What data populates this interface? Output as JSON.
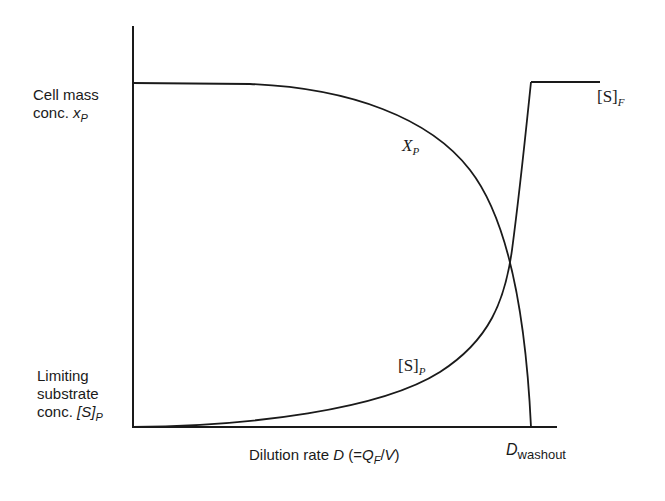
{
  "diagram": {
    "y_axis_labels": {
      "top": {
        "line1": "Cell mass",
        "line2_prefix": "conc. ",
        "var": "x",
        "sub": "P"
      },
      "bottom": {
        "line1": "Limiting",
        "line2": "substrate",
        "line3_prefix": "conc. ",
        "var": "[S]",
        "sub": "P"
      }
    },
    "x_axis_label": {
      "prefix": "Dilution rate ",
      "var": "D",
      "paren_open": " (=",
      "q": "Q",
      "q_sub": "F",
      "slash": "/",
      "v": "V",
      "paren_close": ")"
    },
    "washout_label": {
      "var": "D",
      "sub": "washout"
    },
    "curves": {
      "xp": {
        "var": "X",
        "sub": "P"
      },
      "sp": {
        "var": "[S]",
        "sub": "P"
      },
      "sf": {
        "var": "[S]",
        "sub": "F"
      }
    },
    "colors": {
      "line": "#1a1a1a",
      "background": "#ffffff"
    }
  }
}
